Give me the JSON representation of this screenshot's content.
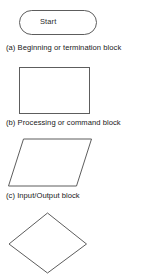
{
  "figure": {
    "background_color": "#ffffff",
    "stroke_color": "#5d5d5d",
    "text_color": "#202020",
    "blocks": [
      {
        "id": "terminator",
        "shape": "stadium",
        "label": "Start",
        "caption": "(a) Beginning or termination block"
      },
      {
        "id": "process",
        "shape": "rectangle",
        "label": "",
        "caption": "(b) Processing or command block"
      },
      {
        "id": "io",
        "shape": "parallelogram",
        "label": "",
        "caption": "(c) Input/Output block"
      },
      {
        "id": "decision",
        "shape": "diamond",
        "label": "",
        "caption": ""
      }
    ]
  }
}
